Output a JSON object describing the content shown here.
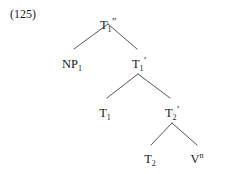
{
  "figure": {
    "example_number": "(125)",
    "caption": "",
    "background_color": "#ffffff",
    "line_color": "#555555",
    "text_color": "#1a1a1a"
  },
  "tree": {
    "type": "syntax-tree",
    "nodes": [
      {
        "id": "root",
        "label": "T1\"",
        "base": "T",
        "subscript": "1",
        "prime": "″",
        "superscript": "",
        "x": 108,
        "y": 18
      },
      {
        "id": "np1",
        "label": "NP1",
        "base": "NP",
        "subscript": "1",
        "prime": "",
        "superscript": "",
        "x": 72,
        "y": 57
      },
      {
        "id": "tbar1",
        "label": "T1'",
        "base": "T",
        "subscript": "1",
        "prime": "′",
        "superscript": "",
        "x": 139,
        "y": 57
      },
      {
        "id": "t1",
        "label": "T1",
        "base": "T",
        "subscript": "1",
        "prime": "",
        "superscript": "",
        "x": 105,
        "y": 106
      },
      {
        "id": "tbar2",
        "label": "T2'",
        "base": "T",
        "subscript": "2",
        "prime": "′",
        "superscript": "",
        "x": 172,
        "y": 106
      },
      {
        "id": "t2",
        "label": "T2",
        "base": "T",
        "subscript": "2",
        "prime": "",
        "superscript": "",
        "x": 150,
        "y": 152
      },
      {
        "id": "vn",
        "label": "Vn",
        "base": "V",
        "subscript": "",
        "prime": "",
        "superscript": "n",
        "x": 197,
        "y": 152
      }
    ],
    "edges": [
      {
        "from": "root",
        "to": "np1",
        "x1": 108,
        "y1": 24,
        "x2": 74,
        "y2": 49
      },
      {
        "from": "root",
        "to": "tbar1",
        "x1": 108,
        "y1": 24,
        "x2": 137,
        "y2": 49
      },
      {
        "from": "tbar1",
        "to": "t1",
        "x1": 138,
        "y1": 74,
        "x2": 107,
        "y2": 98
      },
      {
        "from": "tbar1",
        "to": "tbar2",
        "x1": 138,
        "y1": 74,
        "x2": 170,
        "y2": 98
      },
      {
        "from": "tbar2",
        "to": "t2",
        "x1": 172,
        "y1": 123,
        "x2": 151,
        "y2": 145
      },
      {
        "from": "tbar2",
        "to": "vn",
        "x1": 172,
        "y1": 123,
        "x2": 197,
        "y2": 145
      }
    ]
  }
}
